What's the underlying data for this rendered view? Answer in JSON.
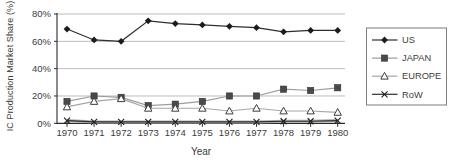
{
  "figure": {
    "background": "#ffffff",
    "text_color": "#3c3c3c",
    "axis_color": "#2b2b2b",
    "grid_color": "#bcbcbc",
    "legend_border_color": "#7d7d7d"
  },
  "chart_data": {
    "type": "line",
    "title": "",
    "xlabel": "Year",
    "ylabel": "IC Production Market Share (%)",
    "categories": [
      "1970",
      "1971",
      "1972",
      "1973",
      "1974",
      "1975",
      "1976",
      "1977",
      "1978",
      "1979",
      "1980"
    ],
    "y_ticks": [
      0,
      20,
      40,
      60,
      80
    ],
    "y_tick_labels": [
      "0%",
      "20%",
      "40%",
      "60%",
      "80%"
    ],
    "ylim": [
      0,
      80
    ],
    "grid": "horizontal",
    "legend_position": "right",
    "series": [
      {
        "name": "US",
        "marker": "diamond",
        "line_color": "#2e2e2e",
        "marker_color": "#1c1c1c",
        "values": [
          69,
          61,
          60,
          75,
          73,
          72,
          71,
          70,
          67,
          68,
          68
        ]
      },
      {
        "name": "JAPAN",
        "marker": "square",
        "line_color": "#9c9c9c",
        "marker_color": "#4a4a4a",
        "values": [
          16,
          20,
          19,
          13,
          14,
          16,
          20,
          20,
          25,
          24,
          26
        ]
      },
      {
        "name": "EUROPE",
        "marker": "triangle-open",
        "line_color": "#a6a6a6",
        "marker_color": "#ffffff",
        "marker_stroke": "#3d3d3d",
        "values": [
          12,
          16,
          18,
          11,
          11,
          11,
          9,
          11,
          9,
          9,
          8
        ]
      },
      {
        "name": "RoW",
        "marker": "x",
        "line_color": "#2e2e2e",
        "line_halo_color": "#adadad",
        "marker_color": "#1c1c1c",
        "values": [
          2,
          1,
          1,
          1,
          1,
          1,
          1,
          1,
          1.5,
          1.5,
          2
        ]
      }
    ]
  }
}
